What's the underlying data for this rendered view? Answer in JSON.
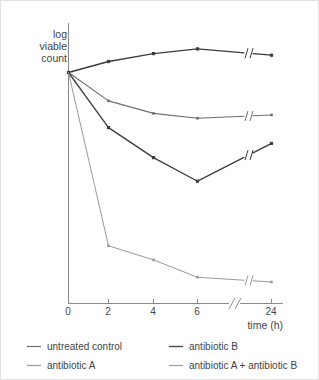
{
  "chart_data": {
    "type": "line",
    "title": "",
    "xlabel": "time (h)",
    "ylabel": "log viable count",
    "ylabel_lines": [
      "log",
      "viable",
      "count"
    ],
    "x": [
      0,
      2,
      4,
      6,
      24
    ],
    "xtick_labels": [
      "0",
      "2",
      "4",
      "6",
      "24"
    ],
    "xlim": [
      0,
      24
    ],
    "axis_break": true,
    "axis_break_note": "//",
    "grid": false,
    "yaxis_ticks": false,
    "legend_position": "below",
    "series": [
      {
        "name": "untreated control",
        "label": "untreated control",
        "color": "#3c3c3c",
        "width": 1.3,
        "marker": "square",
        "values": [
          7.0,
          7.35,
          7.6,
          7.75,
          7.55
        ]
      },
      {
        "name": "antibiotic B",
        "label": "antibiotic B",
        "color": "#6e6e6e",
        "width": 1.1,
        "marker": "square",
        "values": [
          7.0,
          6.1,
          5.7,
          5.55,
          5.65
        ]
      },
      {
        "name": "antibiotic A",
        "label": "antibiotic A",
        "color": "#3c3c3c",
        "width": 1.3,
        "marker": "square",
        "values": [
          7.0,
          5.25,
          4.3,
          3.55,
          4.75
        ]
      },
      {
        "name": "antibiotic A + antibiotic B",
        "label": "antibiotic A + antibiotic B",
        "color": "#9a9a9a",
        "width": 1.0,
        "marker": "square",
        "values": [
          7.0,
          1.5,
          1.05,
          0.5,
          0.35
        ]
      }
    ]
  },
  "legend": {
    "entries": [
      {
        "label": "untreated control",
        "color": "#3c3c3c",
        "column": 0,
        "row": 0
      },
      {
        "label": "antibiotic A",
        "color": "#9a9a9a",
        "column": 0,
        "row": 1
      },
      {
        "label": "antibiotic B",
        "color": "#3c3c3c",
        "column": 1,
        "row": 0
      },
      {
        "label": "antibiotic A + antibiotic B",
        "color": "#9a9a9a",
        "column": 1,
        "row": 1
      }
    ]
  }
}
